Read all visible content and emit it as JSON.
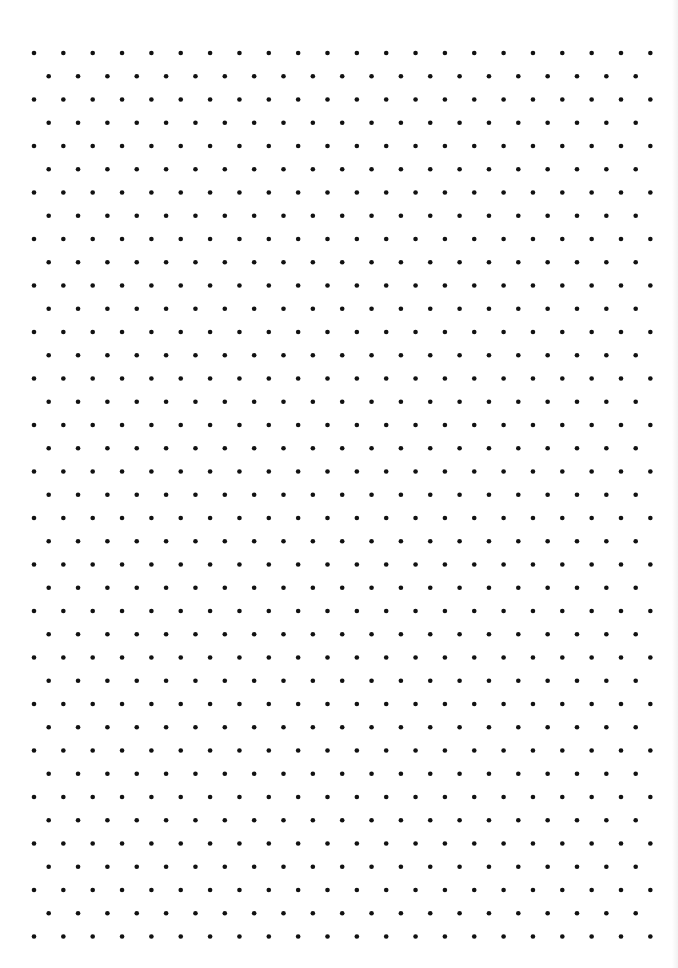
{
  "page": {
    "type": "isometric-dot-grid-paper",
    "background_color": "#ffffff",
    "dot_color": "#111111"
  },
  "grid": {
    "rows": 39,
    "dots_per_even_row": 22,
    "dots_per_odd_row": 21,
    "origin_x": 34,
    "origin_y": 53,
    "spacing_x": 29.35,
    "spacing_y": 23.25,
    "odd_row_offset_x": 14.7,
    "dot_radius": 2.3
  }
}
